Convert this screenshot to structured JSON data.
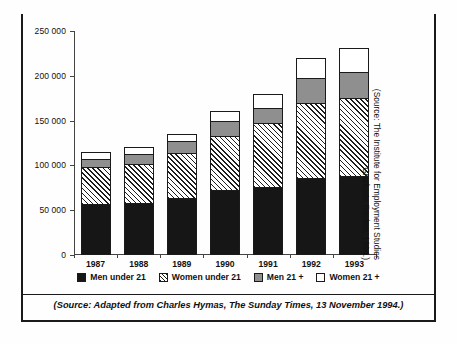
{
  "chart_data": {
    "type": "bar",
    "subtype": "stacked-vertical",
    "title": "",
    "xlabel": "",
    "ylabel": "",
    "categories": [
      "1987",
      "1988",
      "1989",
      "1990",
      "1991",
      "1992",
      "1993"
    ],
    "series": [
      {
        "name": "Men under 21",
        "key": "men-u21",
        "fill": "solid-black",
        "color": "#161616",
        "values": [
          56000,
          57000,
          63000,
          71000,
          75000,
          85000,
          87000
        ]
      },
      {
        "name": "Women under 21",
        "key": "women-u21",
        "fill": "diagonal-hatch",
        "color": "#ffffff",
        "values": [
          41000,
          44000,
          50000,
          61000,
          71000,
          83000,
          87000
        ]
      },
      {
        "name": "Men 21 +",
        "key": "men-21p",
        "fill": "solid-grey",
        "color": "#8f8f8f",
        "values": [
          9000,
          11000,
          13000,
          17000,
          17000,
          28000,
          29000
        ]
      },
      {
        "name": "Women 21 +",
        "key": "women-21p",
        "fill": "solid-white",
        "color": "#ffffff",
        "values": [
          8000,
          8000,
          8000,
          11000,
          16000,
          23000,
          27000
        ]
      }
    ],
    "totals": [
      114000,
      120000,
      134000,
      160000,
      179000,
      219000,
      230000
    ],
    "ylim": [
      0,
      250000
    ],
    "yticks": [
      0,
      50000,
      100000,
      150000,
      200000,
      250000
    ],
    "ytick_labels": [
      "0",
      "50 000",
      "100 000",
      "150 000",
      "200 000",
      "250 000"
    ],
    "grid": false,
    "legend_position": "bottom"
  },
  "legend": {
    "items": [
      {
        "label": "Men under 21",
        "swatch": "solid-black-swatch"
      },
      {
        "label": "Women under 21",
        "swatch": "diagonal-hatch-swatch"
      },
      {
        "label": "Men 21 +",
        "swatch": "solid-grey-swatch"
      },
      {
        "label": "Women 21 +",
        "swatch": "outline-white-swatch"
      }
    ]
  },
  "notes": {
    "source_bottom": "(Source: Adapted from Charles Hymas, The Sunday Times, 13 November 1994.)",
    "source_side": "(Source: The Institute for Employment Studies\nGraduate Review, 1994.)"
  },
  "colors": {
    "men_under_21": "#161616",
    "women_under_21": "#ffffff",
    "men_21_plus": "#8f8f8f",
    "women_21_plus": "#ffffff",
    "axis": "#444444",
    "frame": "#1a1a1a",
    "text": "#111111"
  }
}
